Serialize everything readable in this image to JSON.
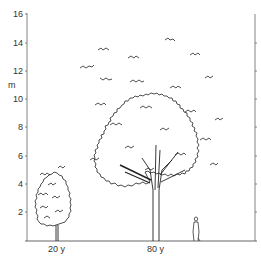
{
  "figure": {
    "type": "tree-growth-illustration",
    "y_axis": {
      "unit": "m",
      "ticks": [
        "2",
        "4",
        "6",
        "8",
        "10",
        "12",
        "14",
        "16"
      ],
      "range": [
        0,
        16
      ]
    },
    "trees": [
      {
        "label": "20 y",
        "approx_height_m": 6,
        "crown_width_m": 3
      },
      {
        "label": "80 y",
        "approx_height_m": 15.5,
        "crown_width_m": 12
      }
    ],
    "figure_scale": {
      "label": "human figure",
      "approx_height_m": 1.8
    },
    "line_color": "#333333",
    "background": "#ffffff"
  }
}
